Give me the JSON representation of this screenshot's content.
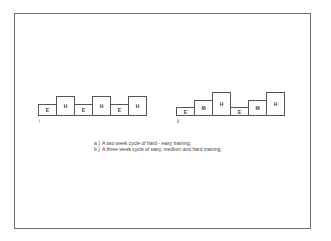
{
  "diagram_a": {
    "sublabel": "i",
    "boxes": [
      {
        "label": "E",
        "level": "easy"
      },
      {
        "label": "H",
        "level": "hard"
      },
      {
        "label": "E",
        "level": "easy"
      },
      {
        "label": "H",
        "level": "hard"
      },
      {
        "label": "E",
        "level": "easy"
      },
      {
        "label": "H",
        "level": "hard"
      }
    ]
  },
  "diagram_b": {
    "sublabel": "ii",
    "boxes": [
      {
        "label": "E",
        "level": "easy"
      },
      {
        "label": "M",
        "level": "medium"
      },
      {
        "label": "H",
        "level": "hard"
      },
      {
        "label": "E",
        "level": "easy"
      },
      {
        "label": "M",
        "level": "medium"
      },
      {
        "label": "H",
        "level": "hard"
      }
    ]
  },
  "caption": {
    "lines": [
      {
        "key": "a )",
        "text": "A two week cycle of hard - easy training."
      },
      {
        "key": "b )",
        "text": "A three week cycle of easy, medium and hard training."
      }
    ]
  }
}
